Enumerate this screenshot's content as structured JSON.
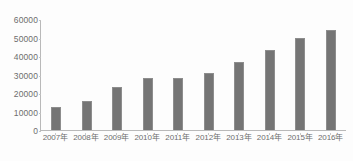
{
  "chart_data": {
    "type": "bar",
    "title": "",
    "subtitle": "",
    "xlabel": "",
    "ylabel": "",
    "categories": [
      "2007年",
      "2008年",
      "2009年",
      "2010年",
      "2011年",
      "2012年",
      "2013年",
      "2014年",
      "2015年",
      "2016年"
    ],
    "values": [
      12500,
      15500,
      23500,
      28000,
      28300,
      31000,
      37000,
      43500,
      49800,
      53800
    ],
    "ylim": [
      0,
      60000
    ],
    "yticks": [
      0,
      10000,
      20000,
      30000,
      40000,
      50000,
      60000
    ],
    "ytick_labels": [
      "0",
      "10000",
      "20000",
      "30000",
      "40000",
      "50000",
      "60000"
    ],
    "grid": false,
    "legend": null,
    "legend_position": "none",
    "series": [
      {
        "name": "",
        "values": [
          12500,
          15500,
          23500,
          28000,
          28300,
          31000,
          37000,
          43500,
          49800,
          53800
        ]
      }
    ],
    "colors": {
      "bar": "#757575",
      "bar_border": "#8d8d8d",
      "axis": "#b9b9b9",
      "tick_text": "#6d6d6d",
      "background": "#fdfdfd"
    }
  }
}
